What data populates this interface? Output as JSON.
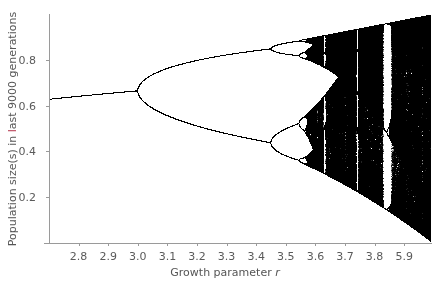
{
  "chart_data": {
    "type": "scatter",
    "title": "",
    "subtitle": "",
    "xlabel": "Growth parameter r",
    "xlabel_parts": {
      "text": "Growth parameter ",
      "variable": "r"
    },
    "ylabel": "Population size(s) in last 9000 generations",
    "ylabel_parts": {
      "before": "Population size(s) in ",
      "highlight": "l",
      "after": "ast 9000 generations"
    },
    "xlim": [
      2.7,
      3.99
    ],
    "ylim": [
      0.0,
      1.0
    ],
    "x_ticks": [
      2.8,
      2.9,
      3.0,
      3.1,
      3.2,
      3.3,
      3.4,
      3.5,
      3.6,
      3.7,
      3.8,
      3.9
    ],
    "x_tick_labels": [
      "2.8",
      "2.9",
      "3.0",
      "3.1",
      "3.2",
      "3.3",
      "3.4",
      "3.5",
      "3.6",
      "3.7",
      "3.8",
      "5.9"
    ],
    "y_ticks": [
      0.2,
      0.4,
      0.6,
      0.8
    ],
    "y_tick_labels": [
      "0.2",
      "0.4",
      "0.6",
      "0.8"
    ],
    "grid": false,
    "legend": null,
    "series": [
      {
        "name": "logistic map attractor",
        "model": "x_{n+1} = r * x_n * (1 - x_n)",
        "key_points": [
          {
            "r": 2.7,
            "x": [
              0.63
            ]
          },
          {
            "r": 3.0,
            "x": [
              0.667
            ]
          },
          {
            "r": 3.2,
            "x": [
              0.513,
              0.799
            ]
          },
          {
            "r": 3.449,
            "x": [
              0.44,
              0.85
            ]
          },
          {
            "r": 3.5,
            "x": [
              0.383,
              0.501,
              0.827,
              0.875
            ]
          },
          {
            "r": 3.57,
            "x_range": [
              0.35,
              0.89
            ],
            "note": "onset of chaos"
          },
          {
            "r": 3.83,
            "x": [
              0.156,
              0.505,
              0.957
            ],
            "note": "period-3 window"
          },
          {
            "r": 3.99,
            "x_range": [
              0.0,
              1.0
            ]
          }
        ],
        "bifurcation_points": [
          3.0,
          3.449,
          3.544,
          3.5644,
          3.5688
        ]
      }
    ],
    "colors": {
      "points": "#000000",
      "axes": "#9a9a9a",
      "tick_text": "#5a5a5a",
      "label_highlight": "#b3334a"
    }
  }
}
